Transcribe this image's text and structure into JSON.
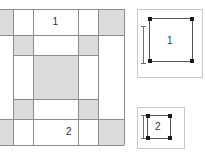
{
  "figure": {
    "type": "quilt-block-diagram",
    "colors": {
      "shaded_cell": "#dcdcdc",
      "white_cell": "#ffffff",
      "grid_line": "#8c8c8c",
      "panel_border": "#c8c8c8",
      "square_outline": "#555555",
      "handle": "#1a1a1a",
      "dimension_line": "#6e6e6e",
      "text": "#333333"
    }
  },
  "main_grid": {
    "name": "quilt-block-grid",
    "columns": 5,
    "rows": 5,
    "column_widths": [
      26,
      20,
      45,
      20,
      26
    ],
    "row_heights": [
      26,
      20,
      44,
      20,
      26
    ],
    "cells": [
      {
        "row": 0,
        "col": 0,
        "fill": "shaded"
      },
      {
        "row": 0,
        "col": 1,
        "fill": "white"
      },
      {
        "row": 0,
        "col": 2,
        "fill": "white"
      },
      {
        "row": 0,
        "col": 3,
        "fill": "white"
      },
      {
        "row": 0,
        "col": 4,
        "fill": "shaded"
      },
      {
        "row": 1,
        "col": 0,
        "fill": "white"
      },
      {
        "row": 1,
        "col": 1,
        "fill": "shaded"
      },
      {
        "row": 1,
        "col": 2,
        "fill": "white"
      },
      {
        "row": 1,
        "col": 3,
        "fill": "shaded"
      },
      {
        "row": 1,
        "col": 4,
        "fill": "white"
      },
      {
        "row": 2,
        "col": 0,
        "fill": "white"
      },
      {
        "row": 2,
        "col": 1,
        "fill": "white"
      },
      {
        "row": 2,
        "col": 2,
        "fill": "shaded"
      },
      {
        "row": 2,
        "col": 3,
        "fill": "white"
      },
      {
        "row": 2,
        "col": 4,
        "fill": "white"
      },
      {
        "row": 3,
        "col": 0,
        "fill": "white"
      },
      {
        "row": 3,
        "col": 1,
        "fill": "shaded"
      },
      {
        "row": 3,
        "col": 2,
        "fill": "white"
      },
      {
        "row": 3,
        "col": 3,
        "fill": "shaded"
      },
      {
        "row": 3,
        "col": 4,
        "fill": "white"
      },
      {
        "row": 4,
        "col": 0,
        "fill": "shaded"
      },
      {
        "row": 4,
        "col": 1,
        "fill": "white"
      },
      {
        "row": 4,
        "col": 2,
        "fill": "white"
      },
      {
        "row": 4,
        "col": 3,
        "fill": "white"
      },
      {
        "row": 4,
        "col": 4,
        "fill": "shaded"
      }
    ],
    "labels": {
      "piece_1": "1",
      "piece_2": "2"
    }
  },
  "detail_panels": [
    {
      "name": "detail-panel-1",
      "label": "1",
      "shape": "square",
      "handles": [
        "top-left",
        "top-right",
        "bottom-left",
        "bottom-right"
      ],
      "dimension_indicator": "vertical-double-arrow"
    },
    {
      "name": "detail-panel-2",
      "label": "2",
      "shape": "square",
      "handles": [
        "top-left",
        "top-right",
        "bottom-left",
        "bottom-right"
      ],
      "dimension_indicator": "vertical-double-arrow"
    }
  ]
}
